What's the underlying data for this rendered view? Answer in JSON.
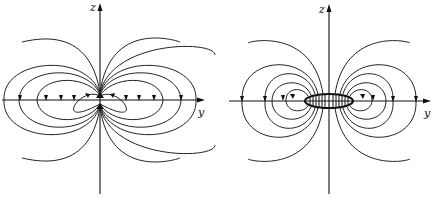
{
  "figures": [
    {
      "id": "point-dipole",
      "axes": {
        "vertical_label": "z",
        "horizontal_label": "y"
      },
      "description": "Field lines of a point magnetic dipole"
    },
    {
      "id": "current-loop",
      "axes": {
        "vertical_label": "z",
        "horizontal_label": "y"
      },
      "description": "Field lines of a finite current loop / magnetized disk"
    }
  ]
}
